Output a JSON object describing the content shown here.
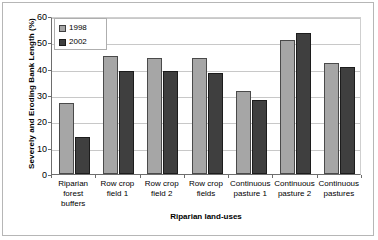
{
  "chart_data": {
    "type": "bar",
    "title": "",
    "xlabel": "Riparian land-uses",
    "ylabel": "Severely and Eroding Bank Length (%)",
    "categories": [
      "Riparian forest buffers",
      "Row crop field 1",
      "Row crop field 2",
      "Row crop fields",
      "Continuous pasture 1",
      "Continuous pasture 2",
      "Continuous pastures"
    ],
    "category_lines": [
      [
        "Riparian",
        "forest",
        "buffers"
      ],
      [
        "Row crop",
        "field 1"
      ],
      [
        "Row crop",
        "field 2"
      ],
      [
        "Row crop",
        "fields"
      ],
      [
        "Continuous",
        "pasture 1"
      ],
      [
        "Continuous",
        "pasture 2"
      ],
      [
        "Continuous",
        "pastures"
      ]
    ],
    "series": [
      {
        "name": "1998",
        "color": "#a6a6a6",
        "values": [
          27,
          45,
          44,
          44,
          31.5,
          51,
          42
        ]
      },
      {
        "name": "2002",
        "color": "#3f3f3f",
        "values": [
          14,
          39,
          39,
          38.5,
          28,
          53.5,
          40.5
        ]
      }
    ],
    "ylim": [
      0,
      60
    ],
    "yticks": [
      0,
      10,
      20,
      30,
      40,
      50,
      60
    ],
    "ytick_labels": [
      "0",
      "10",
      "20",
      "30",
      "40",
      "50",
      "60"
    ],
    "grid": true,
    "legend_position": "top-left",
    "legend_entries": [
      "1998",
      "2002"
    ]
  }
}
